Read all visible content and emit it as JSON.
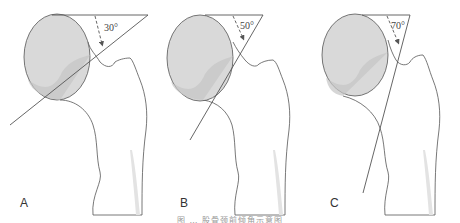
{
  "figure": {
    "panels": [
      {
        "label": "A",
        "angle": "30°"
      },
      {
        "label": "B",
        "angle": "50°"
      },
      {
        "label": "C",
        "angle": "70°"
      }
    ],
    "caption": "图 … 股骨颈前倾角示意图"
  },
  "colors": {
    "outline": "#555555",
    "head_fill": "#d9d9d9",
    "head_shadow": "#c4c4c4",
    "shaft_shade": "#e3e3e3",
    "line": "#555555"
  }
}
